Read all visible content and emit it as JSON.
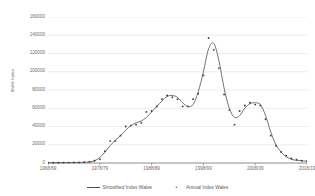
{
  "chart_data": {
    "type": "line",
    "title": "",
    "xlabel": "",
    "ylabel": "WdIS Index",
    "ylim": [
      0,
      160000
    ],
    "ytick_step": 20000,
    "yticks": [
      0,
      20000,
      40000,
      60000,
      80000,
      100000,
      120000,
      140000,
      160000
    ],
    "ytick_labels": [
      "0",
      "20000",
      "40000",
      "60000",
      "80000",
      "100000",
      "120000",
      "140000",
      "160000"
    ],
    "xticks": [
      "1968/69",
      "1978/79",
      "1988/89",
      "1998/99",
      "2008/09",
      "2018/19"
    ],
    "xtick_values": [
      1968,
      1978,
      1988,
      1998,
      2008,
      2018
    ],
    "xlim": [
      1968,
      2018
    ],
    "grid": "horizontal",
    "legend_position": "bottom",
    "legend": [
      {
        "name": "Smoothed Index Wales",
        "style": "line"
      },
      {
        "name": "Annual Index Wales",
        "style": "marker"
      }
    ],
    "x": [
      1968,
      1969,
      1970,
      1971,
      1972,
      1973,
      1974,
      1975,
      1976,
      1977,
      1978,
      1979,
      1980,
      1981,
      1982,
      1983,
      1984,
      1985,
      1986,
      1987,
      1988,
      1989,
      1990,
      1991,
      1992,
      1993,
      1994,
      1995,
      1996,
      1997,
      1998,
      1999,
      2000,
      2001,
      2002,
      2003,
      2004,
      2005,
      2006,
      2007,
      2008,
      2009,
      2010,
      2011,
      2012,
      2013,
      2014,
      2015,
      2016,
      2017,
      2018
    ],
    "series": [
      {
        "name": "Smoothed Index Wales",
        "style": "line",
        "color": "#595959",
        "values": [
          300,
          300,
          350,
          400,
          450,
          500,
          600,
          800,
          1200,
          2500,
          6000,
          12000,
          19000,
          25000,
          30000,
          36000,
          41000,
          44000,
          46000,
          50000,
          56000,
          62000,
          68000,
          73000,
          74000,
          72000,
          66000,
          62000,
          64000,
          78000,
          100000,
          125000,
          131000,
          112000,
          82000,
          60000,
          50000,
          52000,
          60000,
          65000,
          66000,
          64000,
          52000,
          34000,
          20000,
          12000,
          7000,
          4000,
          3000,
          2500,
          2000
        ]
      },
      {
        "name": "Annual Index Wales",
        "style": "marker",
        "color": "#404040",
        "values": [
          300,
          300,
          350,
          400,
          450,
          500,
          600,
          800,
          1200,
          2500,
          4000,
          13000,
          24000,
          24000,
          30000,
          40000,
          41000,
          42000,
          44000,
          56000,
          57000,
          62000,
          70000,
          74000,
          72000,
          70000,
          62000,
          62000,
          70000,
          76000,
          96000,
          137000,
          124000,
          104000,
          75000,
          58000,
          42000,
          57000,
          63000,
          66000,
          64000,
          63000,
          48000,
          30000,
          19000,
          12000,
          8000,
          5000,
          3500,
          2500,
          2000
        ]
      }
    ]
  }
}
